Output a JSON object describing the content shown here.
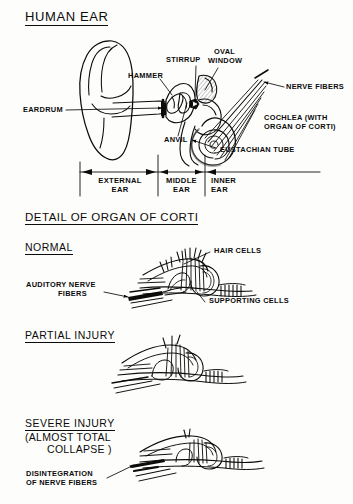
{
  "document": {
    "background_color": "#fdfdfb",
    "ink_color": "#0b0b0b",
    "shading_color": "#c9c9c9"
  },
  "sections": {
    "ear": {
      "title": "HUMAN EAR",
      "labels": {
        "stirrup": "STIRRUP",
        "oval_window_line1": "OVAL",
        "oval_window_line2": "WINDOW",
        "hammer": "HAMMER",
        "nerve_fibers": "NERVE FIBERS",
        "eardrum": "EARDRUM",
        "anvil": "ANVIL",
        "cochlea_line1": "COCHLEA (WITH",
        "cochlea_line2": "ORGAN OF CORTI)",
        "eustachian_tube": "EUSTACHIAN TUBE"
      },
      "scale": {
        "external_line1": "EXTERNAL",
        "external_line2": "EAR",
        "middle_line1": "MIDDLE",
        "middle_line2": "EAR",
        "inner_line1": "INNER",
        "inner_line2": "EAR"
      }
    },
    "corti": {
      "title": "DETAIL OF ORGAN OF CORTI",
      "panels": [
        {
          "name": "normal",
          "title": "NORMAL",
          "labels": {
            "hair_cells": "HAIR CELLS",
            "auditory_line1": "AUDITORY NERVE",
            "auditory_line2": "FIBERS",
            "supporting_cells": "SUPPORTING CELLS"
          }
        },
        {
          "name": "partial-injury",
          "title": "PARTIAL INJURY",
          "labels": {}
        },
        {
          "name": "severe-injury",
          "title": "SEVERE INJURY",
          "subtitle_line1": "(ALMOST TOTAL",
          "subtitle_line2": "COLLAPSE )",
          "labels": {
            "disintegration_line1": "DISINTEGRATION",
            "disintegration_line2": "OF NERVE FIBERS"
          }
        }
      ]
    }
  }
}
